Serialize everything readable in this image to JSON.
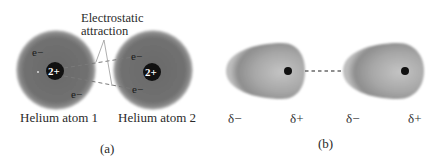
{
  "panel_a": {
    "annotation": {
      "line1": "Electrostatic",
      "line2": "attraction"
    },
    "atoms": [
      {
        "label": "Helium atom 1",
        "nucleus_charge": "2+",
        "electrons": [
          "e−",
          "e−"
        ]
      },
      {
        "label": "Helium atom 2",
        "nucleus_charge": "2+",
        "electrons": [
          "e−",
          "e−"
        ]
      }
    ],
    "caption": "(a)"
  },
  "panel_b": {
    "charges": [
      "δ−",
      "δ+",
      "δ−",
      "δ+"
    ],
    "caption": "(b)"
  },
  "colors": {
    "atom_fill": "#6e6e6e",
    "atom_edge": "#9a9a9a",
    "nucleus": "#111111",
    "drop_fill": "#9c9c9c",
    "dash": "#6a6a6a"
  }
}
